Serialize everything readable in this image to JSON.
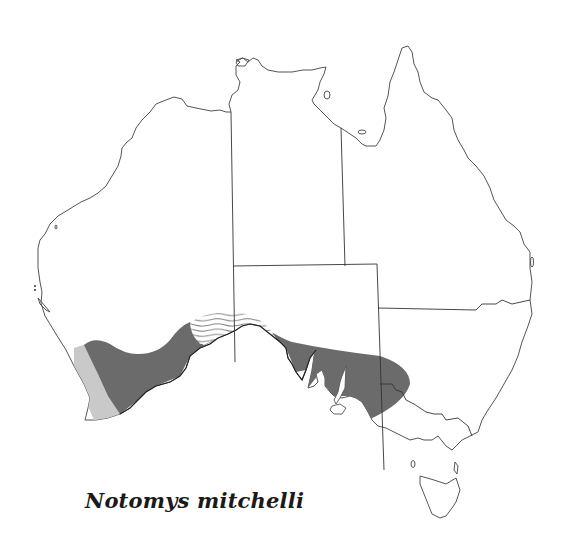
{
  "map": {
    "title": "Notomys mitchelli",
    "region": "Australia",
    "legend": [
      {
        "name": "distribution-range",
        "fill": "#6b6b6b",
        "description": "dark grey shaded area"
      },
      {
        "name": "extinct-or-uncertain-range-wavy",
        "fill": "wavy-lines",
        "description": "white area with wavy lines"
      },
      {
        "name": "former-range-light",
        "fill": "#c9c9c9",
        "description": "light grey shaded area"
      }
    ],
    "colors": {
      "range": "#6b6b6b",
      "former_range": "#c9c9c9",
      "coastline": "#555555",
      "borders": "#333333"
    }
  }
}
